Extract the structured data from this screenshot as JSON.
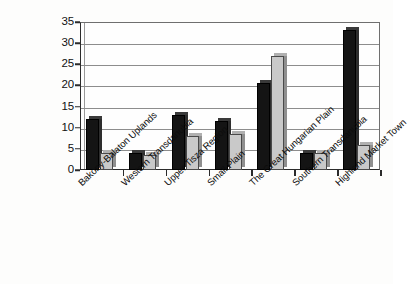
{
  "chart_data": {
    "type": "bar",
    "title": "",
    "subtitle": "",
    "xlabel": "",
    "ylabel": "",
    "ylim": [
      0,
      35
    ],
    "y_ticks": [
      0,
      5,
      10,
      15,
      20,
      25,
      30,
      35
    ],
    "grid": true,
    "legend": "none",
    "categories": [
      "Bakony-Balaton Uplands",
      "Western Transdanubia",
      "Upper Tisza Region",
      "Small Plain",
      "The Great Hungarian Plain",
      "Southern Transdanubia",
      "Highland Market Town"
    ],
    "series": [
      {
        "name": "series-1",
        "color": "#141414",
        "values": [
          12,
          4,
          13,
          11.5,
          20.5,
          4,
          33
        ]
      },
      {
        "name": "series-2",
        "color": "#c9c9c9",
        "values": [
          4,
          3.5,
          8,
          8.5,
          27,
          4,
          6
        ]
      }
    ]
  },
  "axis": {
    "y_tick_labels": [
      "0",
      "5",
      "10",
      "15",
      "20",
      "25",
      "30",
      "35"
    ]
  },
  "colors": {
    "series_1": "#141414",
    "series_2": "#c9c9c9",
    "axis": "#2b2b2b",
    "gridline": "#8d8d8d",
    "background": "#fdfdfc"
  }
}
